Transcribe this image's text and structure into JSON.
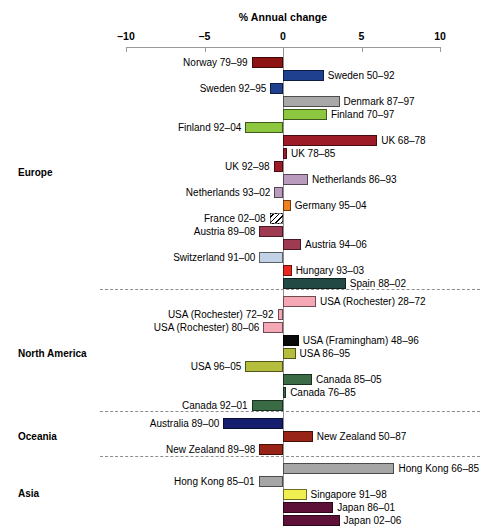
{
  "chart_data": {
    "type": "bar",
    "orientation": "horizontal",
    "title": "% Annual change",
    "xlabel": "% Annual change",
    "ylabel": "",
    "xlim": [
      -10,
      10
    ],
    "xticks": [
      -10,
      -5,
      0,
      5,
      10
    ],
    "xtick_labels": [
      "–10",
      "–5",
      "0",
      "5",
      "10"
    ],
    "grid": false,
    "legend": "none",
    "zero_reference": 0,
    "groups": [
      {
        "name": "Europe",
        "bars": [
          {
            "label": "Norway 79–99",
            "value": -2.0,
            "color": "#8e1414",
            "label_side": "left",
            "hatched": false
          },
          {
            "label": "Sweden 50–92",
            "value": 2.6,
            "color": "#1f3f8f",
            "label_side": "right",
            "hatched": false
          },
          {
            "label": "Sweden 92–95",
            "value": -0.8,
            "color": "#1f3f8f",
            "label_side": "left",
            "hatched": false
          },
          {
            "label": "Denmark 87–97",
            "value": 3.6,
            "color": "#a8a8a8",
            "label_side": "right",
            "hatched": false
          },
          {
            "label": "Finland 70–97",
            "value": 2.8,
            "color": "#8dc63f",
            "label_side": "right",
            "hatched": false
          },
          {
            "label": "Finland 92–04",
            "value": -2.4,
            "color": "#8dc63f",
            "label_side": "left",
            "hatched": false
          },
          {
            "label": "UK 68–78",
            "value": 6.0,
            "color": "#9d1b26",
            "label_side": "right",
            "hatched": false
          },
          {
            "label": "UK 78–85",
            "value": 0.25,
            "color": "#9d1b26",
            "label_side": "right",
            "hatched": false
          },
          {
            "label": "UK 92–98",
            "value": -0.6,
            "color": "#9d1b26",
            "label_side": "left",
            "hatched": false
          },
          {
            "label": "Netherlands 86–93",
            "value": 1.6,
            "color": "#b89bbd",
            "label_side": "right",
            "hatched": false
          },
          {
            "label": "Netherlands 93–02",
            "value": -0.55,
            "color": "#b89bbd",
            "label_side": "left",
            "hatched": false
          },
          {
            "label": "Germany 95–04",
            "value": 0.5,
            "color": "#ef8020",
            "label_side": "right",
            "hatched": false
          },
          {
            "label": "France 02–08",
            "value": -0.85,
            "color": "#ffffff",
            "label_side": "left",
            "hatched": true
          },
          {
            "label": "Austria 89–08",
            "value": -1.5,
            "color": "#9e3b52",
            "label_side": "left",
            "hatched": false
          },
          {
            "label": "Austria 94–06",
            "value": 1.15,
            "color": "#9e3b52",
            "label_side": "right",
            "hatched": false
          },
          {
            "label": "Switzerland 91–00",
            "value": -1.5,
            "color": "#c3d1e6",
            "label_side": "left",
            "hatched": false
          },
          {
            "label": "Hungary 93–03",
            "value": 0.55,
            "color": "#e8281e",
            "label_side": "right",
            "hatched": false
          },
          {
            "label": "Spain 88–02",
            "value": 4.0,
            "color": "#224944",
            "label_side": "right",
            "hatched": false
          }
        ]
      },
      {
        "name": "North America",
        "bars": [
          {
            "label": "USA (Rochester) 28–72",
            "value": 2.1,
            "color": "#f4a7b4",
            "label_side": "right",
            "hatched": false
          },
          {
            "label": "USA (Rochester) 72–92",
            "value": -0.35,
            "color": "#f4a7b4",
            "label_side": "left",
            "hatched": false
          },
          {
            "label": "USA (Rochester) 80–06",
            "value": -1.25,
            "color": "#f4a7b4",
            "label_side": "left",
            "hatched": false
          },
          {
            "label": "USA (Framingham) 48–96",
            "value": 1.0,
            "color": "#0a0a0a",
            "label_side": "right",
            "hatched": false
          },
          {
            "label": "USA 86–95",
            "value": 0.8,
            "color": "#b5bd3c",
            "label_side": "right",
            "hatched": false
          },
          {
            "label": "USA 96–05",
            "value": -2.4,
            "color": "#b5bd3c",
            "label_side": "left",
            "hatched": false
          },
          {
            "label": "Canada 85–05",
            "value": 1.85,
            "color": "#3b6b45",
            "label_side": "right",
            "hatched": false
          },
          {
            "label": "Canada 76–85",
            "value": 0.2,
            "color": "#3b6b45",
            "label_side": "right",
            "hatched": false
          },
          {
            "label": "Canada 92–01",
            "value": -2.0,
            "color": "#3b6b45",
            "label_side": "left",
            "hatched": false
          }
        ]
      },
      {
        "name": "Oceania",
        "bars": [
          {
            "label": "Australia 89–00",
            "value": -3.8,
            "color": "#141d6e",
            "label_side": "left",
            "hatched": false
          },
          {
            "label": "New Zealand 50–87",
            "value": 1.9,
            "color": "#982418",
            "label_side": "right",
            "hatched": false
          },
          {
            "label": "New Zealand 89–98",
            "value": -1.5,
            "color": "#982418",
            "label_side": "left",
            "hatched": false
          }
        ]
      },
      {
        "name": "Asia",
        "bars": [
          {
            "label": "Hong Kong 66–85",
            "value": 7.1,
            "color": "#a6a6a6",
            "label_side": "right",
            "hatched": false
          },
          {
            "label": "Hong Kong 85–01",
            "value": -1.55,
            "color": "#a6a6a6",
            "label_side": "left",
            "hatched": false
          },
          {
            "label": "Singapore 91–98",
            "value": 1.5,
            "color": "#f0ef52",
            "label_side": "right",
            "hatched": false
          },
          {
            "label": "Japan 86–01",
            "value": 3.2,
            "color": "#5d1038",
            "label_side": "right",
            "hatched": false
          },
          {
            "label": "Japan 02–06",
            "value": 3.6,
            "color": "#5d1038",
            "label_side": "right",
            "hatched": false
          }
        ]
      }
    ]
  },
  "caption": ""
}
